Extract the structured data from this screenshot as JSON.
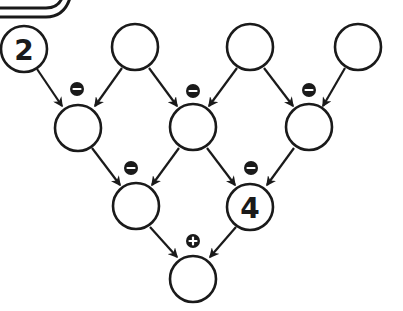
{
  "diagram": {
    "type": "arithmetic-pyramid",
    "colors": {
      "stroke": "#1a1a1a",
      "fill": "#ffffff",
      "badge": "#1a1a1a",
      "badge_glyph": "#ffffff"
    },
    "rows": [
      {
        "row": 1,
        "nodes": [
          {
            "id": "r1n1",
            "value": "2"
          },
          {
            "id": "r1n2",
            "value": ""
          },
          {
            "id": "r1n3",
            "value": ""
          },
          {
            "id": "r1n4",
            "value": ""
          }
        ]
      },
      {
        "row": 2,
        "nodes": [
          {
            "id": "r2n1",
            "value": "",
            "operator": "-"
          },
          {
            "id": "r2n2",
            "value": "",
            "operator": "-"
          },
          {
            "id": "r2n3",
            "value": "",
            "operator": "-"
          }
        ]
      },
      {
        "row": 3,
        "nodes": [
          {
            "id": "r3n1",
            "value": "",
            "operator": "-"
          },
          {
            "id": "r3n2",
            "value": "4",
            "operator": "-"
          }
        ]
      },
      {
        "row": 4,
        "nodes": [
          {
            "id": "r4n1",
            "value": "",
            "operator": "+"
          }
        ]
      }
    ],
    "edges": [
      {
        "from": "r1n1",
        "to": "r2n1"
      },
      {
        "from": "r1n2",
        "to": "r2n1"
      },
      {
        "from": "r1n2",
        "to": "r2n2"
      },
      {
        "from": "r1n3",
        "to": "r2n2"
      },
      {
        "from": "r1n3",
        "to": "r2n3"
      },
      {
        "from": "r1n4",
        "to": "r2n3"
      },
      {
        "from": "r2n1",
        "to": "r3n1"
      },
      {
        "from": "r2n2",
        "to": "r3n1"
      },
      {
        "from": "r2n2",
        "to": "r3n2"
      },
      {
        "from": "r2n3",
        "to": "r3n2"
      },
      {
        "from": "r3n1",
        "to": "r4n1"
      },
      {
        "from": "r3n2",
        "to": "r4n1"
      }
    ],
    "labels": {
      "r1n1": "2",
      "r3n2": "4",
      "op_minus": "−",
      "op_plus": "+"
    }
  }
}
